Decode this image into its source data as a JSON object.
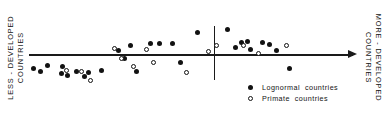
{
  "figure": {
    "background_color": "#ffffff",
    "ink_color": "#121212"
  },
  "axis": {
    "left_label": "LESS - DEVELOPED\nCOUNTRIES",
    "right_label": "MORE - DEVELOPED\nCOUNTRIES",
    "arrow_direction": "right",
    "divider_present": true
  },
  "legend": {
    "entries": [
      {
        "marker": "filled-circle",
        "label": "Lognormal  countries"
      },
      {
        "marker": "open-circle",
        "label": "Primate  countries"
      }
    ]
  },
  "chart_data": {
    "type": "scatter",
    "title": "",
    "xlabel": "",
    "ylabel": "",
    "xlim": [
      29,
      353
    ],
    "ylim": [
      26,
      80
    ],
    "grid": false,
    "legend_position": "bottom-right",
    "annotations": [
      {
        "text": "LESS - DEVELOPED COUNTRIES",
        "position": "left-axis"
      },
      {
        "text": "MORE - DEVELOPED COUNTRIES",
        "position": "right-axis"
      },
      {
        "text": "vertical-divider",
        "x": 214
      }
    ],
    "series": [
      {
        "name": "Lognormal  countries",
        "marker": "filled-circle",
        "points": [
          [
            33,
            68
          ],
          [
            40,
            71
          ],
          [
            47,
            65
          ],
          [
            62,
            66
          ],
          [
            61,
            73
          ],
          [
            67,
            75
          ],
          [
            76,
            71
          ],
          [
            88,
            72
          ],
          [
            84,
            76
          ],
          [
            101,
            70
          ],
          [
            118,
            50
          ],
          [
            124,
            58
          ],
          [
            130,
            45
          ],
          [
            136,
            71
          ],
          [
            150,
            43
          ],
          [
            159,
            43
          ],
          [
            172,
            43
          ],
          [
            180,
            62
          ],
          [
            197,
            32
          ],
          [
            227,
            29
          ],
          [
            235,
            47
          ],
          [
            241,
            42
          ],
          [
            247,
            41
          ],
          [
            250,
            49
          ],
          [
            262,
            42
          ],
          [
            269,
            44
          ],
          [
            276,
            50
          ],
          [
            289,
            68
          ]
        ]
      },
      {
        "name": "Primate  countries",
        "marker": "open-circle",
        "points": [
          [
            66,
            70
          ],
          [
            81,
            71
          ],
          [
            90,
            80
          ],
          [
            114,
            48
          ],
          [
            121,
            58
          ],
          [
            133,
            66
          ],
          [
            146,
            49
          ],
          [
            153,
            62
          ],
          [
            186,
            72
          ],
          [
            208,
            51
          ],
          [
            216,
            45
          ],
          [
            243,
            45
          ],
          [
            258,
            53
          ],
          [
            286,
            45
          ]
        ]
      }
    ]
  }
}
